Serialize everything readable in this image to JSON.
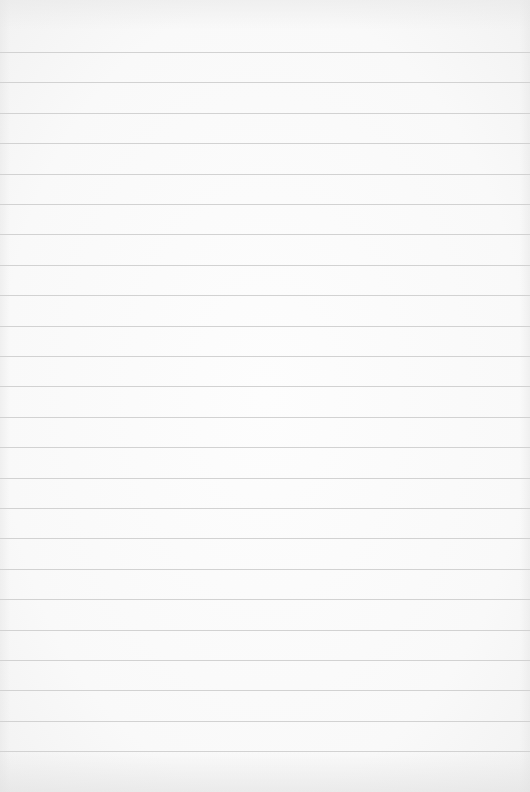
{
  "page": {
    "type": "lined-paper",
    "background_color": "#fbfbfb",
    "rule_color": "#d2d2d2",
    "rules": {
      "first_y": 52,
      "spacing": 30.4,
      "count": 24
    }
  }
}
